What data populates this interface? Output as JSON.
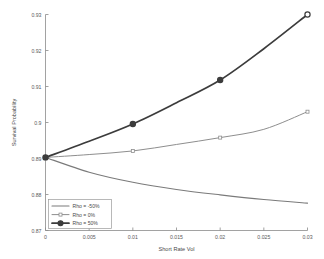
{
  "chart_data": {
    "type": "line",
    "title": "",
    "xlabel": "Short Rate Vol",
    "ylabel": "Survival Probability",
    "xlim": [
      0,
      0.03
    ],
    "ylim": [
      0.87,
      0.93
    ],
    "grid": false,
    "legend_position": "bottom-left",
    "x": [
      0,
      0.005,
      0.01,
      0.015,
      0.02,
      0.025,
      0.03
    ],
    "xticklabels": [
      "0",
      "0.005",
      "0.01",
      "0.015",
      "0.02",
      "0.025",
      "0.03"
    ],
    "yticks": [
      0.87,
      0.88,
      0.89,
      0.9,
      0.91,
      0.92,
      0.93
    ],
    "yticklabels": [
      "0.87",
      "0.88",
      "0.89",
      "0.9",
      "0.91",
      "0.92",
      "0.93"
    ],
    "series": [
      {
        "name": "Rho = -50%",
        "color": "#7a7a7a",
        "width": 1.1,
        "marker": "none",
        "values": [
          0.8903,
          0.8862,
          0.8834,
          0.8814,
          0.8799,
          0.8786,
          0.8776
        ]
      },
      {
        "name": "Rho = 0%",
        "color": "#8e8e8e",
        "width": 1.0,
        "marker": "square",
        "values": [
          0.8903,
          0.8911,
          0.8921,
          0.8939,
          0.8958,
          0.8981,
          0.903
        ]
      },
      {
        "name": "Rho = 50%",
        "color": "#3c3c3c",
        "width": 1.7,
        "marker": "circle",
        "values": [
          0.8903,
          0.8948,
          0.8996,
          0.9055,
          0.9118,
          0.9205,
          0.93
        ]
      }
    ],
    "marker_x": [
      0,
      0.01,
      0.02,
      0.03
    ],
    "legend_entries": [
      "Rho = -50%",
      "Rho = 0%",
      "Rho = 50%"
    ]
  },
  "axes": {
    "x_axis_label": "Short Rate Vol",
    "y_axis_label": "Survival Probability"
  }
}
